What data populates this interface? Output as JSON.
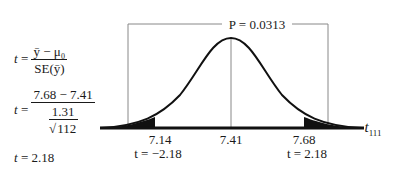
{
  "formulas": {
    "line1": {
      "lhs": "t",
      "numerator": "ȳ − μ₀",
      "denominator": "SE(ȳ)"
    },
    "line2": {
      "lhs": "t",
      "numerator": "7.68 − 7.41",
      "denominator_num": "1.31",
      "denominator_den": "112"
    },
    "line3": {
      "lhs": "t",
      "result": "2.18"
    }
  },
  "diagram": {
    "p_label": "P = 0.0313",
    "axis_label": "t",
    "axis_subscript": "111",
    "ticks": [
      {
        "value": "7.14",
        "t": "t = −2.18"
      },
      {
        "value": "7.41",
        "t": ""
      },
      {
        "value": "7.68",
        "t": "t = 2.18"
      }
    ],
    "curve_color": "#111111",
    "box_color": "#888888"
  }
}
